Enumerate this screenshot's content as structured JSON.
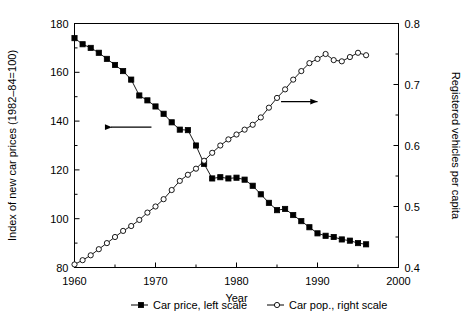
{
  "chart_data": {
    "type": "line",
    "title": "",
    "xlabel": "Year",
    "ylabel": "Index of new car prices (1982–84=100)",
    "y2label": "Registered vehicles per capita",
    "xlim": [
      1960,
      2000
    ],
    "ylim": [
      80,
      180
    ],
    "y2lim": [
      0.4,
      0.8
    ],
    "xticks": [
      1960,
      1970,
      1980,
      1990,
      2000
    ],
    "xtick_labels": [
      "1960",
      "1970",
      "1980",
      "1990",
      "2000"
    ],
    "yticks": [
      80,
      100,
      120,
      140,
      160,
      180
    ],
    "ytick_labels": [
      "80",
      "100",
      "120",
      "140",
      "160",
      "180"
    ],
    "y_minor_ticks": [
      90,
      110,
      130,
      150,
      170
    ],
    "y2ticks": [
      0.4,
      0.5,
      0.6,
      0.7,
      0.8
    ],
    "y2tick_labels": [
      "0.4",
      "0.5",
      "0.6",
      "0.7",
      "0.8"
    ],
    "y2_minor_ticks": [
      0.45,
      0.55,
      0.65,
      0.75
    ],
    "x_minor_ticks": [
      1965,
      1975,
      1985,
      1995
    ],
    "grid": false,
    "legend_position": "bottom",
    "annotations": [
      {
        "name": "left-scale-arrow",
        "direction": "left",
        "x_from": 1969.5,
        "x_to": 1964.5,
        "y_value": 137.5
      },
      {
        "name": "right-scale-arrow",
        "direction": "right",
        "x_from": 1985.5,
        "x_to": 1990.0,
        "y2_value": 0.672
      }
    ],
    "series": [
      {
        "name": "Car price, left scale",
        "axis": "left",
        "marker": "filled-square",
        "color": "#000000",
        "x": [
          1960,
          1961,
          1962,
          1963,
          1964,
          1965,
          1966,
          1967,
          1968,
          1969,
          1970,
          1971,
          1972,
          1973,
          1974,
          1975,
          1976,
          1977,
          1978,
          1979,
          1980,
          1981,
          1982,
          1983,
          1984,
          1985,
          1986,
          1987,
          1988,
          1989,
          1990,
          1991,
          1992,
          1993,
          1994,
          1995,
          1996
        ],
        "values": [
          174.0,
          171.5,
          170.0,
          168.0,
          165.5,
          163.0,
          160.5,
          157.0,
          150.5,
          148.5,
          146.0,
          143.0,
          139.5,
          136.5,
          136.3,
          130.0,
          122.5,
          116.5,
          117.0,
          116.5,
          116.8,
          116.0,
          113.5,
          110.0,
          106.5,
          103.5,
          104.0,
          101.5,
          99.0,
          96.5,
          94.0,
          93.0,
          92.5,
          91.5,
          91.0,
          90.0,
          89.5
        ]
      },
      {
        "name": "Car pop., right scale",
        "axis": "right",
        "marker": "open-circle",
        "color": "#000000",
        "x": [
          1960,
          1961,
          1962,
          1963,
          1964,
          1965,
          1966,
          1967,
          1968,
          1969,
          1970,
          1971,
          1972,
          1973,
          1974,
          1975,
          1976,
          1977,
          1978,
          1979,
          1980,
          1981,
          1982,
          1983,
          1984,
          1985,
          1986,
          1987,
          1988,
          1989,
          1990,
          1991,
          1992,
          1993,
          1994,
          1995,
          1996
        ],
        "values": [
          0.405,
          0.412,
          0.42,
          0.43,
          0.44,
          0.45,
          0.46,
          0.468,
          0.478,
          0.49,
          0.5,
          0.512,
          0.527,
          0.542,
          0.552,
          0.562,
          0.575,
          0.588,
          0.6,
          0.61,
          0.618,
          0.626,
          0.634,
          0.646,
          0.662,
          0.678,
          0.692,
          0.708,
          0.722,
          0.735,
          0.742,
          0.75,
          0.74,
          0.738,
          0.745,
          0.752,
          0.748
        ]
      }
    ]
  },
  "legend": {
    "items": [
      {
        "label": "Car price, left scale",
        "marker": "filled-square"
      },
      {
        "label": "Car pop., right scale",
        "marker": "open-circle"
      }
    ]
  }
}
